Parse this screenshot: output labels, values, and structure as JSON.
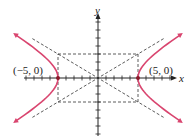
{
  "chart_data": {
    "type": "line",
    "title": "",
    "equation": "x^2/25 - y^2/9 = 1",
    "a": 5,
    "b": 3,
    "xlabel": "x",
    "ylabel": "y",
    "xlim": [
      -9,
      9
    ],
    "ylim": [
      -7,
      7
    ],
    "grid": false,
    "vertices": [
      {
        "x": -5,
        "y": 0,
        "label": "(−5, 0)"
      },
      {
        "x": 5,
        "y": 0,
        "label": "(5, 0)"
      }
    ],
    "asymptotes": [
      "y = 3x/5",
      "y = -3x/5"
    ],
    "rectangle": {
      "x": [
        -5,
        5
      ],
      "y": [
        -3,
        3
      ]
    },
    "colors": {
      "curve": "#d9456f",
      "axes": "#222222",
      "dashed": "#333333"
    }
  }
}
